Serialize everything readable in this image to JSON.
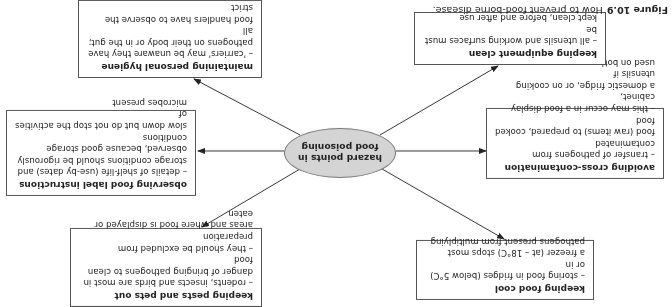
{
  "figure": {
    "label": "Figure 10.9",
    "caption": "How to prevent food-borne disease.",
    "orientation": "rotated 180 degrees"
  },
  "hub": {
    "label_line1": "hazard points in",
    "label_line2": "food poisoning",
    "fill_color": "#d4d4d4"
  },
  "nodes": [
    {
      "id": "keeping-food-cool",
      "title": "keeping food cool",
      "text": "– storing food in fridges (below 5°C) or in\na freezer (at – 18°C) stops most\npathogens present from multiplying"
    },
    {
      "id": "keeping-pests-out",
      "title": "keeping pests and pets out",
      "text": "– rodents, insects and birds are most in\ndanger of bringing pathogens to clean food\n– they should be excluded from preparation\nareas and where food is displayed or eaten"
    },
    {
      "id": "avoiding-cross-contamination",
      "title": "avoiding cross-contamination",
      "text": "– transfer of pathogens from contaminated\nfood (raw items) to prepared, cooked food\n– this may occur in a food display cabinet,\na domestic fridge, or on cooking utensils if\nused on both"
    },
    {
      "id": "observing-food-label",
      "title": "observing food label instructions",
      "text": "– details of shelf-life (use-by dates) and\nstorage conditions should be rigorously\nobserved, because good storage conditions\nslow down but do not stop the activities of\nmicrobes present"
    },
    {
      "id": "keeping-equipment-clean",
      "title": "keeping equipment clean",
      "text": "– all utensils and working surfaces must be\nkept clean, before and after use"
    },
    {
      "id": "maintaining-personal-hygiene",
      "title": "maintaining personal hygiene",
      "text": "– 'carriers' may be unaware they have\npathogens on their body or in the gut; all\nfood handlers have to observe the strict\nrules of personal hygiene"
    }
  ]
}
